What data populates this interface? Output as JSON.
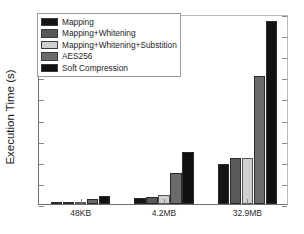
{
  "chart_data": {
    "type": "bar",
    "title": "",
    "xlabel": "",
    "ylabel": "Execution Time (s)",
    "categories": [
      "48KB",
      "4.2MB",
      "32.9MB"
    ],
    "ylim": [
      0,
      9
    ],
    "yticks": [
      0,
      1,
      2,
      3,
      4,
      5,
      6,
      7,
      8,
      9
    ],
    "ytick_labels": [
      "0",
      "1",
      "2",
      "3",
      "4",
      "5",
      "6",
      "7",
      "8",
      "9"
    ],
    "grid": false,
    "legend_position": "upper-left",
    "series": [
      {
        "name": "Mapping",
        "color": "#151515",
        "values": [
          0.03,
          0.28,
          1.9
        ]
      },
      {
        "name": "Mapping+Whitening",
        "color": "#595959",
        "values": [
          0.04,
          0.35,
          2.17
        ]
      },
      {
        "name": "Mapping+Whitening+Substition",
        "color": "#cfcfcf",
        "values": [
          0.06,
          0.42,
          2.2
        ]
      },
      {
        "name": "AES256",
        "color": "#6b6b6b",
        "values": [
          0.22,
          1.48,
          6.05
        ]
      },
      {
        "name": "Soft Compression",
        "color": "#111111",
        "values": [
          0.37,
          2.47,
          8.65
        ]
      }
    ]
  },
  "legend": {
    "entries": [
      {
        "label": "Mapping"
      },
      {
        "label": "Mapping+Whitening"
      },
      {
        "label": "Mapping+Whitening+Substition"
      },
      {
        "label": "AES256"
      },
      {
        "label": "Soft Compression"
      }
    ]
  }
}
